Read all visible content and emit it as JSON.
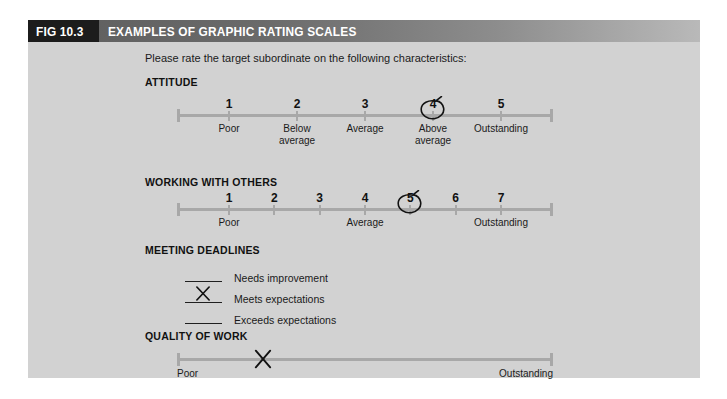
{
  "figure": {
    "number": "FIG 10.3",
    "title": "EXAMPLES OF GRAPHIC RATING SCALES",
    "instruction": "Please rate the target subordinate on the following characteristics:"
  },
  "sections": [
    {
      "heading": "ATTITUDE",
      "type": "numeric-scale",
      "points": [
        {
          "number": "1",
          "label": "Poor"
        },
        {
          "number": "2",
          "label": "Below\naverage"
        },
        {
          "number": "3",
          "label": "Average"
        },
        {
          "number": "4",
          "label": "Above\naverage"
        },
        {
          "number": "5",
          "label": "Outstanding"
        }
      ],
      "circled": "4"
    },
    {
      "heading": "WORKING WITH OTHERS",
      "type": "numeric-scale",
      "points": [
        {
          "number": "1",
          "label": "Poor"
        },
        {
          "number": "2",
          "label": ""
        },
        {
          "number": "3",
          "label": ""
        },
        {
          "number": "4",
          "label": "Average"
        },
        {
          "number": "5",
          "label": ""
        },
        {
          "number": "6",
          "label": ""
        },
        {
          "number": "7",
          "label": "Outstanding"
        }
      ],
      "circled": "5"
    },
    {
      "heading": "MEETING DEADLINES",
      "type": "checklist",
      "options": [
        {
          "label": "Needs improvement",
          "checked": false
        },
        {
          "label": "Meets expectations",
          "checked": true
        },
        {
          "label": "Exceeds expectations",
          "checked": false
        }
      ]
    },
    {
      "heading": "QUALITY OF WORK",
      "type": "continuous-scale",
      "left_label": "Poor",
      "right_label": "Outstanding",
      "mark_position_percent": 23
    }
  ],
  "colors": {
    "panel_background": "#d2d2d2",
    "header_dark": "#1c1c1c",
    "header_gradient_start": "#5e5e5e",
    "header_gradient_end": "#b9b9b9",
    "scale_line": "#a8a8a8",
    "text": "#1a1a1a",
    "mark_ink": "#121212"
  }
}
